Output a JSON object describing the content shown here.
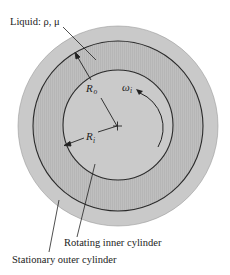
{
  "figure": {
    "colors": {
      "background": "#ffffff",
      "outer_cylinder": "#c9c9c9",
      "liquid": "#bcbcbc",
      "inner_cylinder": "#cacaca",
      "stroke": "#2a2a2a"
    },
    "labels": {
      "liquid": "Liquid: ρ, μ",
      "inner_cylinder": "Rotating inner cylinder",
      "outer_cylinder": "Stationary outer cylinder"
    },
    "symbols": {
      "outer_radius_main": "R",
      "outer_radius_sub": "o",
      "inner_radius_main": "R",
      "inner_radius_sub": "i",
      "angular_velocity_main": "ω",
      "angular_velocity_sub": "i"
    }
  }
}
